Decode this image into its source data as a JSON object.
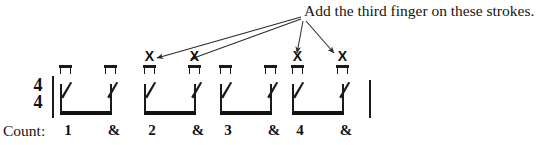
{
  "caption": {
    "text": "Add the third finger on these strokes.",
    "arrow_origin": {
      "x": 302,
      "y": 17
    }
  },
  "notation": {
    "time_signature": {
      "upper": "4",
      "lower": "4"
    },
    "barlines": [
      {
        "name": "opening-barline",
        "x": 52,
        "y": 76,
        "height": 42
      },
      {
        "name": "closing-barline",
        "x": 369,
        "y": 80,
        "height": 38
      }
    ],
    "groups": [
      {
        "beat": "1",
        "left": 60,
        "beam_left": 0,
        "beam_width": 52,
        "notes": [
          {
            "stem_x": 0,
            "slash_x": 1,
            "downstroke_x": 0,
            "x_mark": ""
          },
          {
            "stem_x": 50,
            "slash_x": 47,
            "downstroke_x": 45,
            "x_mark": ""
          }
        ]
      },
      {
        "beat": "2",
        "left": 144,
        "beam_left": 0,
        "beam_width": 52,
        "notes": [
          {
            "stem_x": 0,
            "slash_x": 1,
            "downstroke_x": 0,
            "x_mark": "X"
          },
          {
            "stem_x": 50,
            "slash_x": 47,
            "downstroke_x": 45,
            "x_mark": "X"
          }
        ]
      },
      {
        "beat": "3",
        "left": 220,
        "beam_left": 0,
        "beam_width": 52,
        "notes": [
          {
            "stem_x": 0,
            "slash_x": 1,
            "downstroke_x": 0,
            "x_mark": ""
          },
          {
            "stem_x": 50,
            "slash_x": 47,
            "downstroke_x": 45,
            "x_mark": ""
          }
        ]
      },
      {
        "beat": "4",
        "left": 292,
        "beam_left": 0,
        "beam_width": 52,
        "notes": [
          {
            "stem_x": 0,
            "slash_x": 1,
            "downstroke_x": 0,
            "x_mark": "X"
          },
          {
            "stem_x": 50,
            "slash_x": 47,
            "downstroke_x": 45,
            "x_mark": "X"
          }
        ]
      }
    ]
  },
  "count_row": {
    "label": "Count:",
    "items": [
      {
        "text": "1",
        "x": 61
      },
      {
        "text": "&",
        "x": 107
      },
      {
        "text": "2",
        "x": 145
      },
      {
        "text": "&",
        "x": 191
      },
      {
        "text": "3",
        "x": 221
      },
      {
        "text": "&",
        "x": 267
      },
      {
        "text": "4",
        "x": 293
      },
      {
        "text": "&",
        "x": 339
      }
    ]
  },
  "colors": {
    "ink": "#1a1a1a",
    "beam": "#111111",
    "background": "#ffffff"
  }
}
